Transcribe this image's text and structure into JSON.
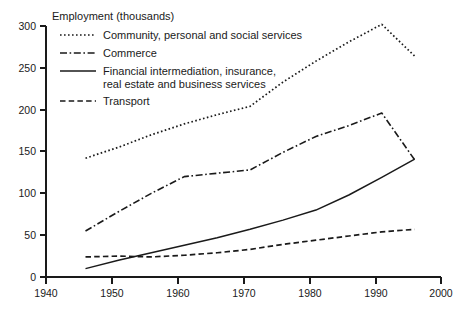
{
  "chart_data": {
    "type": "line",
    "title": "Employment (thousands)",
    "xlabel": "",
    "ylabel": "Employment (thousands)",
    "xlim": [
      1940,
      2000
    ],
    "ylim": [
      0,
      300
    ],
    "xticks": [
      1940,
      1950,
      1960,
      1970,
      1980,
      1990,
      2000
    ],
    "yticks": [
      0,
      50,
      100,
      150,
      200,
      250,
      300
    ],
    "grid": false,
    "legend_position": "upper-left",
    "series": [
      {
        "name": "Community, personal and social services",
        "style": "dotted",
        "x": [
          1946,
          1951,
          1956,
          1961,
          1966,
          1971,
          1976,
          1981,
          1986,
          1991,
          1996
        ],
        "values": [
          142,
          155,
          170,
          183,
          194,
          204,
          233,
          258,
          281,
          302,
          264
        ]
      },
      {
        "name": "Commerce",
        "style": "dash-dot",
        "x": [
          1946,
          1951,
          1956,
          1961,
          1966,
          1971,
          1976,
          1981,
          1986,
          1991,
          1996
        ],
        "values": [
          55,
          78,
          100,
          120,
          124,
          128,
          149,
          168,
          181,
          196,
          140
        ]
      },
      {
        "name": "Financial intermediation, insurance, real estate and business services",
        "style": "solid",
        "x": [
          1946,
          1951,
          1956,
          1961,
          1966,
          1971,
          1976,
          1981,
          1986,
          1991,
          1996
        ],
        "values": [
          10,
          20,
          29,
          38,
          47,
          57,
          68,
          80,
          98,
          119,
          141
        ]
      },
      {
        "name": "Transport",
        "style": "dashed",
        "x": [
          1946,
          1951,
          1956,
          1961,
          1966,
          1971,
          1976,
          1981,
          1986,
          1991,
          1996
        ],
        "values": [
          24,
          25,
          24,
          26,
          29,
          33,
          39,
          44,
          49,
          54,
          57
        ]
      }
    ]
  },
  "axis": {
    "y_labels": [
      "300",
      "250",
      "200",
      "150",
      "100",
      "50",
      "0"
    ],
    "x_labels": [
      "1940",
      "1950",
      "1960",
      "1970",
      "1980",
      "1990",
      "2000"
    ],
    "title": "Employment (thousands)"
  },
  "legend": {
    "entries": [
      {
        "label": "Community, personal and social services",
        "label2": "",
        "style": "dotted"
      },
      {
        "label": "Commerce",
        "label2": "",
        "style": "dash-dot"
      },
      {
        "label": "Financial intermediation, insurance,",
        "label2": "real estate and business services",
        "style": "solid"
      },
      {
        "label": "Transport",
        "label2": "",
        "style": "dashed"
      }
    ]
  },
  "colors": {
    "ink": "#1a1a1a",
    "background": "#ffffff"
  }
}
